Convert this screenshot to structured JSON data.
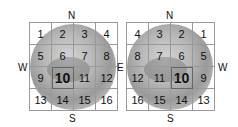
{
  "panels": [
    {
      "name": "left",
      "directions": {
        "north": "N",
        "south": "S",
        "west": "W",
        "east": "E"
      },
      "cells": [
        "1",
        "2",
        "3",
        "4",
        "5",
        "6",
        "7",
        "8",
        "9",
        "10",
        "11",
        "12",
        "13",
        "14",
        "15",
        "16"
      ],
      "highlighted": "10"
    },
    {
      "name": "right",
      "directions": {
        "north": "N",
        "south": "S",
        "west": "W",
        "east": "E"
      },
      "cells": [
        "4",
        "3",
        "2",
        "1",
        "8",
        "7",
        "6",
        "5",
        "12",
        "11",
        "10",
        "9",
        "16",
        "15",
        "14",
        "13"
      ],
      "highlighted": "10"
    }
  ]
}
